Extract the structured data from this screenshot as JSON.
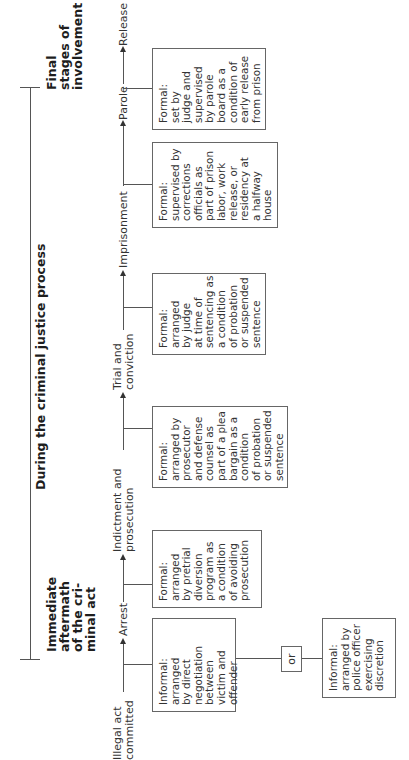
{
  "diagram": {
    "orientation": "rotated-90-ccw",
    "stages": [
      {
        "id": "immediate",
        "lines": [
          "Immediate",
          "aftermath",
          "of the cri-",
          "minal act"
        ]
      },
      {
        "id": "during",
        "lines": [
          "During the criminal justice process"
        ]
      },
      {
        "id": "final",
        "lines": [
          "Final",
          "stages of",
          "involvement"
        ]
      }
    ],
    "steps": [
      {
        "id": "illegal",
        "lines": [
          "Illegal act",
          "committed"
        ]
      },
      {
        "id": "arrest",
        "lines": [
          "Arrest"
        ]
      },
      {
        "id": "indictment",
        "lines": [
          "Indictment and",
          "prosecution"
        ]
      },
      {
        "id": "trial",
        "lines": [
          "Trial and",
          "conviction"
        ]
      },
      {
        "id": "imprisonment",
        "lines": [
          "Imprisonment"
        ]
      },
      {
        "id": "parole",
        "lines": [
          "Parole"
        ]
      },
      {
        "id": "release",
        "lines": [
          "Release"
        ]
      }
    ],
    "boxes": [
      {
        "id": "victim-offender",
        "lines": [
          "Informal:",
          "arranged",
          "by direct",
          "negotiation",
          "between",
          "victim and",
          "offender"
        ]
      },
      {
        "id": "pretrial",
        "lines": [
          "Formal:",
          "arranged",
          "by pretrial",
          "diversion",
          "program as",
          "a condition",
          "of avoiding",
          "prosecution"
        ]
      },
      {
        "id": "prosecutor",
        "lines": [
          "Formal:",
          "arranged by",
          "prosecutor",
          "and defense",
          "counsel as",
          "part of a plea",
          "bargain as a",
          "condition",
          "of probation",
          "or suspended",
          "sentence"
        ]
      },
      {
        "id": "judge",
        "lines": [
          "Formal:",
          "arranged",
          "by judge",
          "at time of",
          "sentencing as",
          "a condition",
          "of probation",
          "or suspended",
          "sentence"
        ]
      },
      {
        "id": "corrections",
        "lines": [
          "Formal:",
          "supervised by",
          "corrections",
          "officials as",
          "part of prison",
          "labor, work",
          "release, or",
          "residency at",
          "a halfway",
          "house"
        ]
      },
      {
        "id": "parole-board",
        "lines": [
          "Formal:",
          "set by",
          "judge and",
          "supervised",
          "by parole",
          "board as a",
          "condition of",
          "early release",
          "from prison"
        ]
      },
      {
        "id": "police",
        "lines": [
          "Informal:",
          "arranged by",
          "police officer",
          "exercising",
          "discretion"
        ]
      }
    ],
    "or_label": "or"
  }
}
